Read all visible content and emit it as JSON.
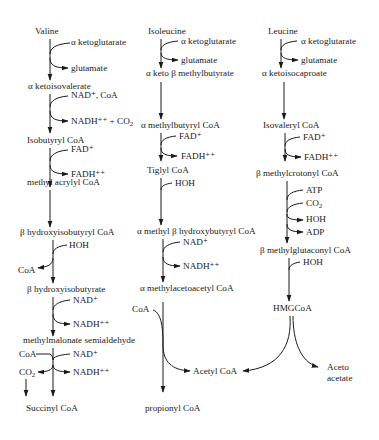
{
  "pathways": {
    "valine": {
      "start": "Valine",
      "steps": [
        {
          "in": "α ketoglutarate",
          "out": "glutamate",
          "product": "α ketoisovalerate"
        },
        {
          "in": "NAD⁺, CoA",
          "out": "NADH⁺⁺ + CO₂",
          "product": "Isobutyryl CoA"
        },
        {
          "in": "FAD⁺",
          "out": "FADH⁺⁺",
          "product": "methyl acrylyl CoA"
        },
        {
          "product": "β hydroxyisobutyryl CoA"
        },
        {
          "in": "HOH",
          "out": "CoA",
          "product": "β hydroxyisobutyrate"
        },
        {
          "in": "NAD⁺",
          "out": "NADH⁺⁺",
          "product": "methylmalonate semialdehyde"
        },
        {
          "in_left": "CoA",
          "in": "NAD⁺",
          "out_left": "CO₂",
          "out": "NADH⁺⁺",
          "product": "Succinyl CoA"
        }
      ]
    },
    "isoleucine": {
      "start": "Isoleucine",
      "steps": [
        {
          "in": "α ketoglutarate",
          "out": "glutamate",
          "product": "α keto β methylbutyrate"
        },
        {
          "product": "α methylbutyryl CoA"
        },
        {
          "in": "FAD⁺",
          "out": "FADH⁺⁺",
          "product": "Tiglyl CoA"
        },
        {
          "in": "HOH",
          "product": "α methyl β hydroxybutyryl CoA"
        },
        {
          "in": "NAD⁺",
          "out": "NADH⁺⁺",
          "product": "α methylacetoacetyl CoA"
        },
        {
          "in_left": "CoA",
          "product": "propionyl CoA",
          "side_product": "Acetyl CoA"
        }
      ]
    },
    "leucine": {
      "start": "Leucine",
      "steps": [
        {
          "in": "α ketoglutarate",
          "out": "glutamate",
          "product": "α ketoisocaproate"
        },
        {
          "product": "Isovaleryl CoA"
        },
        {
          "in": "FAD⁺",
          "out": "FADH⁺⁺",
          "product": "β methylcrotonyl CoA"
        },
        {
          "in": [
            "ATP",
            "CO₂"
          ],
          "out": [
            "HOH",
            "ADP"
          ],
          "product": "β methylglutaconyl CoA"
        },
        {
          "in": "HOH",
          "product": "HMGCoA"
        },
        {
          "products": [
            "Acetyl CoA",
            "Aceto acetate"
          ]
        }
      ]
    }
  },
  "labels": {
    "valine": "Valine",
    "a_ketoglutarate": "α ketoglutarate",
    "glutamate": "glutamate",
    "a_ketoisovalerate": "α ketoisovalerate",
    "nad_coa": "NAD⁺, CoA",
    "nadh_co2": "NADH⁺⁺ + CO",
    "sub2": "2",
    "isobutyryl_coa": "Isobutyryl CoA",
    "fad": "FAD⁺",
    "fadh": "FADH⁺⁺",
    "methyl_acrylyl_coa": "methyl acrylyl CoA",
    "b_hydroxyisobutyryl_coa": "β hydroxyisobutyryl CoA",
    "hoh": "HOH",
    "coa": "CoA",
    "b_hydroxyisobutyrate": "β hydroxyisobutyrate",
    "nad": "NAD⁺",
    "nadh": "NADH⁺⁺",
    "methylmalonate_semialdehyde": "methylmalonate semialdehyde",
    "co": "CO",
    "succinyl_coa": "Succinyl CoA",
    "isoleucine": "Isoleucine",
    "a_keto_b_methylbutyrate": "α keto β methylbutyrate",
    "a_methylbutyryl_coa": "α methylbutyryl CoA",
    "tiglyl_coa": "Tiglyl CoA",
    "a_methyl_b_hydroxybutyryl_coa": "α methyl β hydroxybutyryl CoA",
    "a_methylacetoacetyl_coa": "α methylacetoacetyl CoA",
    "propionyl_coa": "propionyl CoA",
    "acetyl_coa": "Acetyl CoA",
    "leucine": "Leucine",
    "a_ketoisocaproate": "α ketoisocaproate",
    "isovaleryl_coa": "Isovaleryl CoA",
    "b_methylcrotonyl_coa": "β methylcrotonyl CoA",
    "atp": "ATP",
    "adp": "ADP",
    "b_methylglutaconyl_coa": "β methylglutaconyl CoA",
    "hmgcoa": "HMGCoA",
    "aceto": "Aceto",
    "acetate": "acetate"
  },
  "colors": {
    "ink": "#1a1a1a",
    "background": "#ffffff"
  }
}
